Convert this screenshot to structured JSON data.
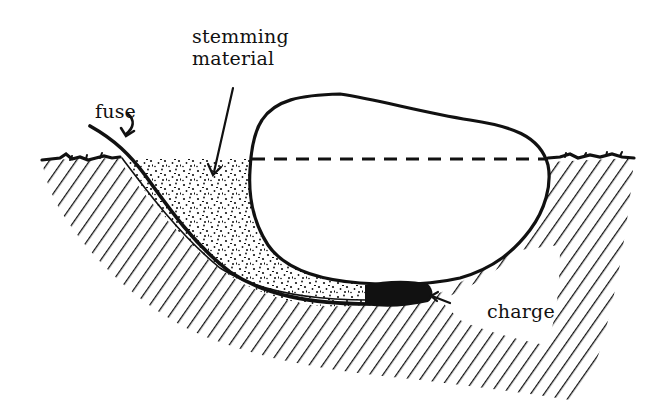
{
  "diagram": {
    "title": "",
    "type": "cross-section illustration",
    "colors": {
      "ink": "#111111",
      "background": "#ffffff"
    },
    "labels": {
      "stemming_line1": "stemming",
      "stemming_line2": "material",
      "fuse": "fuse",
      "charge": "charge"
    },
    "elements": [
      {
        "id": "ground-surface",
        "description": "Ground surface line with grass tufts on both sides"
      },
      {
        "id": "soil-hatching",
        "description": "Diagonal hatching representing undisturbed soil"
      },
      {
        "id": "boulder",
        "description": "Large rounded boulder, partly above and partly below ground"
      },
      {
        "id": "original-ground-level",
        "description": "Dashed line across the boulder showing the ground level"
      },
      {
        "id": "stemming-material",
        "description": "Stippled backfill packed in the excavated trench beside and under the boulder"
      },
      {
        "id": "fuse",
        "description": "Curved fuse line running from above ground down to the charge"
      },
      {
        "id": "charge",
        "description": "Dark explosive charge placed beneath the boulder"
      }
    ]
  }
}
